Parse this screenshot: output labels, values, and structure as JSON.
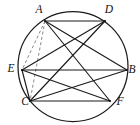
{
  "figure": {
    "shape": "circle-with-inscribed-hexagon",
    "stroke_color": "#1b1b1b",
    "dashed_color": "#8a8a8a",
    "background_color": "#ffffff",
    "circle": {
      "center_x": 73,
      "center_y": 66.5,
      "radius": 55
    },
    "vertices": [
      {
        "id": "A",
        "label": "A",
        "x": 45,
        "y": 21,
        "label_x": 39,
        "label_y": 10
      },
      {
        "id": "D",
        "label": "D",
        "x": 105,
        "y": 21,
        "label_x": 109,
        "label_y": 10
      },
      {
        "id": "B",
        "label": "B",
        "x": 127,
        "y": 70,
        "label_x": 132,
        "label_y": 70
      },
      {
        "id": "F",
        "label": "F",
        "x": 110,
        "y": 101,
        "label_x": 120,
        "label_y": 102
      },
      {
        "id": "C",
        "label": "C",
        "x": 30,
        "y": 101,
        "label_x": 25,
        "label_y": 102
      },
      {
        "id": "E",
        "label": "E",
        "x": 22,
        "y": 70,
        "label_x": 11,
        "label_y": 69
      }
    ],
    "solid_chords": [
      {
        "from": "A",
        "to": "D"
      },
      {
        "from": "A",
        "to": "B"
      },
      {
        "from": "A",
        "to": "F"
      },
      {
        "from": "D",
        "to": "E"
      },
      {
        "from": "D",
        "to": "C"
      },
      {
        "from": "E",
        "to": "B"
      },
      {
        "from": "E",
        "to": "C"
      },
      {
        "from": "E",
        "to": "F"
      },
      {
        "from": "C",
        "to": "B"
      },
      {
        "from": "C",
        "to": "F"
      }
    ],
    "dashed_chords": [
      {
        "from": "A",
        "to": "E"
      },
      {
        "from": "A",
        "to": "C"
      }
    ]
  }
}
